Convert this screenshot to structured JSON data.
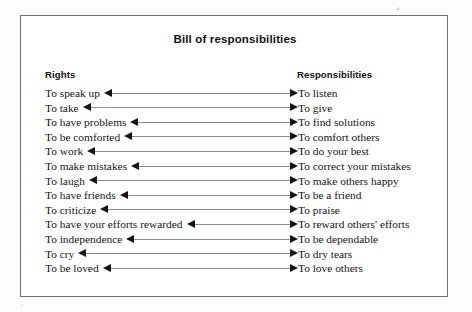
{
  "figure": {
    "title": "Bill of responsibilities",
    "headers": {
      "left": "Rights",
      "right": "Responsibilities"
    },
    "colors": {
      "border": "#6f6f73",
      "text": "#141417",
      "heading": "#111114",
      "connector_line": "#8b8b90",
      "arrow_head": "#131316",
      "background": "#ffffff"
    },
    "arrow_style": "double-headed",
    "row_count": 13,
    "rows": [
      {
        "right_label": "To speak up",
        "left_label": "To listen"
      },
      {
        "right_label": "To take",
        "left_label": "To give"
      },
      {
        "right_label": "To have problems",
        "left_label": "To find solutions"
      },
      {
        "right_label": "To be comforted",
        "left_label": "To comfort others"
      },
      {
        "right_label": "To work",
        "left_label": "To do your best"
      },
      {
        "right_label": "To make mistakes",
        "left_label": "To correct your mistakes"
      },
      {
        "right_label": "To laugh",
        "left_label": "To make others happy"
      },
      {
        "right_label": "To have friends",
        "left_label": "To be a friend"
      },
      {
        "right_label": "To criticize",
        "left_label": "To praise"
      },
      {
        "right_label": "To have your efforts rewarded",
        "left_label": "To reward others' efforts"
      },
      {
        "right_label": "To independence",
        "left_label": "To be dependable"
      },
      {
        "right_label": "To cry",
        "left_label": "To dry tears"
      },
      {
        "right_label": "To be loved",
        "left_label": "To love others"
      }
    ]
  }
}
